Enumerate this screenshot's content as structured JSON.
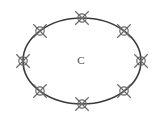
{
  "figure": {
    "canvas": {
      "width": 163,
      "height": 120,
      "background": "#ffffff"
    },
    "center_label": {
      "text": "C",
      "x": 81,
      "y": 61,
      "color": "#4a4a4a"
    },
    "ellipse": {
      "cx": 82,
      "cy": 61,
      "rx": 59,
      "ry": 43,
      "stroke": "#3a3a3a",
      "stroke_width": 1.6
    },
    "marker_style": {
      "kind": "cross-with-circle",
      "arm_length": 9.5,
      "circle_radius": 4.2,
      "stroke": "#6b6b6b",
      "stroke_width": 1.2,
      "count": 8
    },
    "markers": [
      {
        "name": "marker-top",
        "angle_deg": 270,
        "x": 82,
        "y": 18
      },
      {
        "name": "marker-top-right",
        "angle_deg": 315,
        "x": 124,
        "y": 31
      },
      {
        "name": "marker-right",
        "angle_deg": 0,
        "x": 141,
        "y": 61
      },
      {
        "name": "marker-bottom-right",
        "angle_deg": 45,
        "x": 124,
        "y": 91
      },
      {
        "name": "marker-bottom",
        "angle_deg": 90,
        "x": 82,
        "y": 104
      },
      {
        "name": "marker-bottom-left",
        "angle_deg": 135,
        "x": 40,
        "y": 91
      },
      {
        "name": "marker-left",
        "angle_deg": 180,
        "x": 23,
        "y": 61
      },
      {
        "name": "marker-top-left",
        "angle_deg": 225,
        "x": 40,
        "y": 31
      }
    ]
  }
}
